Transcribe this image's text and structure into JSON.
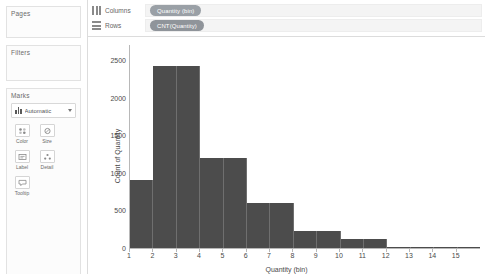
{
  "sidebar": {
    "pages": {
      "title": "Pages"
    },
    "filters": {
      "title": "Filters"
    },
    "marks": {
      "title": "Marks",
      "type_label": "Automatic",
      "type_icon": "bar-chart-icon",
      "buttons": [
        {
          "label": "Color",
          "icon": "color-icon"
        },
        {
          "label": "Size",
          "icon": "size-icon"
        },
        {
          "label": "Label",
          "icon": "label-icon"
        },
        {
          "label": "Detail",
          "icon": "detail-icon"
        },
        {
          "label": "Tooltip",
          "icon": "tooltip-icon"
        }
      ]
    }
  },
  "shelves": {
    "columns": {
      "label": "Columns",
      "pill": "Quantity (bin)",
      "icon": "columns-icon"
    },
    "rows": {
      "label": "Rows",
      "pill": "CNT(Quantity)",
      "icon": "rows-icon"
    }
  },
  "colors": {
    "bar": "#4c4c4c",
    "pill_dimension": "#9aa0a6",
    "pill_measure": "#8f949a",
    "axis": "#b8b8b8"
  },
  "chart_data": {
    "type": "bar",
    "title": "",
    "xlabel": "Quantity (bin)",
    "ylabel": "Count of Quantity",
    "categories": [
      "1",
      "2",
      "3",
      "4",
      "5",
      "6",
      "7",
      "8",
      "9",
      "10",
      "11",
      "12",
      "13",
      "14",
      "15"
    ],
    "values": [
      900,
      2420,
      2420,
      1200,
      1200,
      600,
      600,
      230,
      230,
      120,
      120,
      15,
      10,
      8,
      5
    ],
    "xticks": [
      "1",
      "2",
      "3",
      "4",
      "5",
      "6",
      "7",
      "8",
      "9",
      "10",
      "11",
      "12",
      "13",
      "14",
      "15"
    ],
    "yticks": [
      0,
      500,
      1000,
      1500,
      2000,
      2500
    ],
    "ylim": [
      0,
      2700
    ],
    "grid": false,
    "legend": "none"
  }
}
